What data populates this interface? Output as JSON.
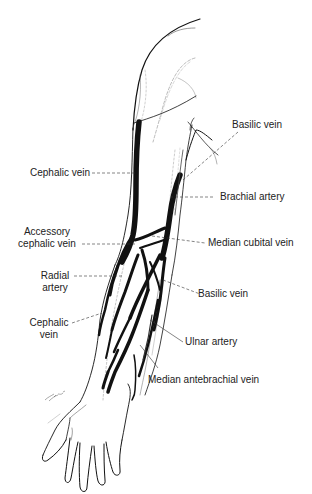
{
  "figure": {
    "colors": {
      "background": "#ffffff",
      "ink": "#111111",
      "leader_line": "#333333",
      "label_text": "#222222"
    }
  },
  "labels": {
    "basilic_vein_upper": "Basilic vein",
    "cephalic_vein_upper": "Cephalic vein",
    "brachial_artery": "Brachial artery",
    "accessory_cephalic_vein_line1": "Accessory",
    "accessory_cephalic_vein_line2": "cephalic vein",
    "median_cubital_vein": "Median cubital vein",
    "radial_artery_line1": "Radial",
    "radial_artery_line2": "artery",
    "basilic_vein_lower": "Basilic vein",
    "cephalic_vein_lower_line1": "Cephalic",
    "cephalic_vein_lower_line2": "vein",
    "ulnar_artery": "Ulnar artery",
    "median_antebrachial_vein": "Median antebrachial vein"
  }
}
